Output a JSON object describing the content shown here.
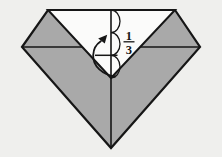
{
  "canvas": {
    "width": "222",
    "height": "157",
    "viewbox": "0 0 222 157",
    "background": "#efefed"
  },
  "colors": {
    "paper_gray": "#a9a9a9",
    "paper_white": "#fbfbfa",
    "line": "#161616"
  },
  "diagram": {
    "fraction_label": {
      "numerator": "1",
      "denominator": "3"
    },
    "geometry": {
      "model_outline": "M22,47 L48,10 L175,10 L200,47 L111,148 Z",
      "horizontal_crease": "M22,47 L200,47",
      "white_flap": "M48,10 L175,10 L111,78 Z",
      "center_crease": "M111,10 L111,148",
      "thirds_arcs": "M111,10 A9,11.33 0 0 1 111,32.66 A9,11.33 0 0 1 111,55.33 A9,11.33 0 0 1 111,78",
      "third_tick": "M95,55.3 L117.5,55.3",
      "fraction_bar": "M123.5,41.8 L134.5,41.8",
      "arrow_shaft": "M115,76.5 C103,74.5 92.5,66.5 93.2,55 C93.5,48.5 96,44.5 100.8,41.3",
      "arrow_head_points": "107.2,34.8 104.8,43.6 98.2,38.4",
      "numerator_x": "128.8",
      "numerator_y": "40",
      "denominator_x": "128.8",
      "denominator_y": "54"
    }
  }
}
